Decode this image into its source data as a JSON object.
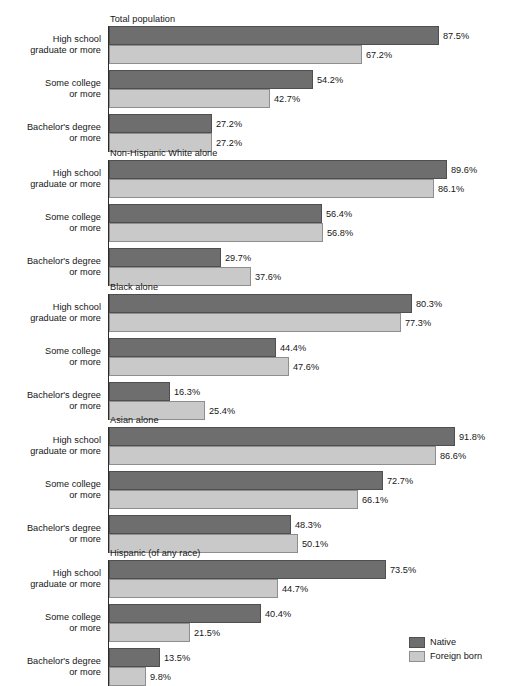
{
  "chart_data": {
    "type": "bar",
    "title": "",
    "xlabel": "",
    "ylabel": "",
    "orientation": "horizontal",
    "grid": false,
    "xlim": [
      0,
      100
    ],
    "value_suffix": "%",
    "legend": {
      "position": "bottom-right",
      "entries": [
        {
          "name": "Native",
          "color": "#6e6e6e"
        },
        {
          "name": "Foreign born",
          "color": "#c9c9c9"
        }
      ]
    },
    "series": [
      {
        "name": "Native",
        "color": "#6e6e6e"
      },
      {
        "name": "Foreign born",
        "color": "#c9c9c9"
      }
    ],
    "categories": [
      "High school graduate or more",
      "Some college or more",
      "Bachelor's degree or more"
    ],
    "panels": [
      {
        "title": "Total population",
        "groups": [
          {
            "label_line1": "High school",
            "label_line2": "graduate or more",
            "native": 87.5,
            "foreign": 67.2,
            "native_label": "87.5%",
            "foreign_label": "67.2%"
          },
          {
            "label_line1": "Some college",
            "label_line2": "or more",
            "native": 54.2,
            "foreign": 42.7,
            "native_label": "54.2%",
            "foreign_label": "42.7%"
          },
          {
            "label_line1": "Bachelor's degree",
            "label_line2": "or more",
            "native": 27.2,
            "foreign": 27.2,
            "native_label": "27.2%",
            "foreign_label": "27.2%"
          }
        ]
      },
      {
        "title": "Non-Hispanic White alone",
        "groups": [
          {
            "label_line1": "High school",
            "label_line2": "graduate or more",
            "native": 89.6,
            "foreign": 86.1,
            "native_label": "89.6%",
            "foreign_label": "86.1%"
          },
          {
            "label_line1": "Some college",
            "label_line2": "or more",
            "native": 56.4,
            "foreign": 56.8,
            "native_label": "56.4%",
            "foreign_label": "56.8%"
          },
          {
            "label_line1": "Bachelor's degree",
            "label_line2": "or more",
            "native": 29.7,
            "foreign": 37.6,
            "native_label": "29.7%",
            "foreign_label": "37.6%"
          }
        ]
      },
      {
        "title": "Black alone",
        "groups": [
          {
            "label_line1": "High school",
            "label_line2": "graduate or more",
            "native": 80.3,
            "foreign": 77.3,
            "native_label": "80.3%",
            "foreign_label": "77.3%"
          },
          {
            "label_line1": "Some college",
            "label_line2": "or more",
            "native": 44.4,
            "foreign": 47.6,
            "native_label": "44.4%",
            "foreign_label": "47.6%"
          },
          {
            "label_line1": "Bachelor's degree",
            "label_line2": "or more",
            "native": 16.3,
            "foreign": 25.4,
            "native_label": "16.3%",
            "foreign_label": "25.4%"
          }
        ]
      },
      {
        "title": "Asian alone",
        "groups": [
          {
            "label_line1": "High school",
            "label_line2": "graduate or more",
            "native": 91.8,
            "foreign": 86.6,
            "native_label": "91.8%",
            "foreign_label": "86.6%"
          },
          {
            "label_line1": "Some college",
            "label_line2": "or more",
            "native": 72.7,
            "foreign": 66.1,
            "native_label": "72.7%",
            "foreign_label": "66.1%"
          },
          {
            "label_line1": "Bachelor's degree",
            "label_line2": "or more",
            "native": 48.3,
            "foreign": 50.1,
            "native_label": "48.3%",
            "foreign_label": "50.1%"
          }
        ]
      },
      {
        "title": "Hispanic (of any race)",
        "groups": [
          {
            "label_line1": "High school",
            "label_line2": "graduate or more",
            "native": 73.5,
            "foreign": 44.7,
            "native_label": "73.5%",
            "foreign_label": "44.7%"
          },
          {
            "label_line1": "Some college",
            "label_line2": "or more",
            "native": 40.4,
            "foreign": 21.5,
            "native_label": "40.4%",
            "foreign_label": "21.5%"
          },
          {
            "label_line1": "Bachelor's degree",
            "label_line2": "or more",
            "native": 13.5,
            "foreign": 9.8,
            "native_label": "13.5%",
            "foreign_label": "9.8%"
          }
        ]
      }
    ]
  }
}
